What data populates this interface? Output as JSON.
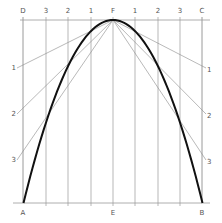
{
  "diagram": {
    "colors": {
      "grid": "#9a9a9a",
      "construction": "#8a8a8a",
      "curve": "#111111",
      "text": "#555555"
    },
    "rect": {
      "left": 23,
      "right": 202,
      "top": 20,
      "bottom": 203
    },
    "apex": {
      "label": "F",
      "x": 113,
      "y": 20
    },
    "top_labels": [
      {
        "text": "D",
        "x": 23
      },
      {
        "text": "3",
        "x": 46
      },
      {
        "text": "2",
        "x": 68
      },
      {
        "text": "1",
        "x": 91
      },
      {
        "text": "F",
        "x": 113
      },
      {
        "text": "1",
        "x": 135
      },
      {
        "text": "2",
        "x": 158
      },
      {
        "text": "3",
        "x": 180
      },
      {
        "text": "C",
        "x": 202
      }
    ],
    "bottom_labels": [
      {
        "text": "A",
        "x": 23
      },
      {
        "text": "E",
        "x": 113
      },
      {
        "text": "B",
        "x": 202
      }
    ],
    "left_labels": [
      {
        "text": "1",
        "y": 66
      },
      {
        "text": "2",
        "y": 112
      },
      {
        "text": "3",
        "y": 158
      }
    ],
    "right_labels": [
      {
        "text": "1",
        "y": 66
      },
      {
        "text": "2",
        "y": 112
      },
      {
        "text": "3",
        "y": 158
      }
    ],
    "vertical_lines_x": [
      23,
      46,
      68,
      91,
      113,
      135,
      158,
      180,
      202
    ]
  }
}
